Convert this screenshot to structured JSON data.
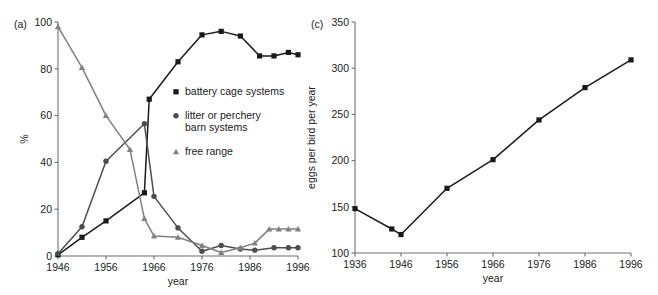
{
  "figure": {
    "background": "#ffffff",
    "panels": [
      "a",
      "c"
    ]
  },
  "panel_a": {
    "label": "(a)",
    "xlabel": "year",
    "ylabel": "%",
    "legend": [
      {
        "label": "battery cage systems",
        "marker": "square",
        "color": "#1a1a1a"
      },
      {
        "label": "litter or perchery",
        "label2": "barn systems",
        "marker": "circle",
        "color": "#4d4d4d"
      },
      {
        "label": "free range",
        "marker": "triangle",
        "color": "#808080"
      }
    ]
  },
  "panel_c": {
    "label": "(c)",
    "xlabel": "year",
    "ylabel": "eggs per bird per year"
  },
  "chart_data": [
    {
      "type": "line",
      "panel": "(a)",
      "title": "",
      "xlabel": "year",
      "ylabel": "%",
      "xlim": [
        1946,
        1996
      ],
      "ylim": [
        0,
        100
      ],
      "xticks": [
        1946,
        1956,
        1966,
        1976,
        1986,
        1996
      ],
      "yticks": [
        0,
        20,
        40,
        60,
        80,
        100
      ],
      "grid": false,
      "legend_position": "center",
      "series": [
        {
          "name": "battery cage systems",
          "marker": "square",
          "color": "#1a1a1a",
          "points": [
            {
              "x": 1946,
              "y": 0.5
            },
            {
              "x": 1951,
              "y": 8
            },
            {
              "x": 1956,
              "y": 15
            },
            {
              "x": 1964,
              "y": 27
            },
            {
              "x": 1965,
              "y": 67
            },
            {
              "x": 1971,
              "y": 83
            },
            {
              "x": 1976,
              "y": 94.5
            },
            {
              "x": 1980,
              "y": 96
            },
            {
              "x": 1984,
              "y": 94
            },
            {
              "x": 1988,
              "y": 85.5
            },
            {
              "x": 1991,
              "y": 85.5
            },
            {
              "x": 1994,
              "y": 87
            },
            {
              "x": 1996,
              "y": 86
            }
          ]
        },
        {
          "name": "litter or perchery barn systems",
          "marker": "circle",
          "color": "#4d4d4d",
          "points": [
            {
              "x": 1946,
              "y": 1
            },
            {
              "x": 1951,
              "y": 12.5
            },
            {
              "x": 1956,
              "y": 40.5
            },
            {
              "x": 1964,
              "y": 56.5
            },
            {
              "x": 1966,
              "y": 25.5
            },
            {
              "x": 1971,
              "y": 12
            },
            {
              "x": 1976,
              "y": 2
            },
            {
              "x": 1980,
              "y": 4.5
            },
            {
              "x": 1984,
              "y": 3
            },
            {
              "x": 1987,
              "y": 2.5
            },
            {
              "x": 1991,
              "y": 3.5
            },
            {
              "x": 1994,
              "y": 3.5
            },
            {
              "x": 1996,
              "y": 3.5
            }
          ]
        },
        {
          "name": "free range",
          "marker": "triangle",
          "color": "#808080",
          "points": [
            {
              "x": 1946,
              "y": 98
            },
            {
              "x": 1951,
              "y": 80.5
            },
            {
              "x": 1956,
              "y": 60
            },
            {
              "x": 1961,
              "y": 45.5
            },
            {
              "x": 1964,
              "y": 16
            },
            {
              "x": 1966,
              "y": 8.5
            },
            {
              "x": 1971,
              "y": 8
            },
            {
              "x": 1976,
              "y": 4.5
            },
            {
              "x": 1980,
              "y": 1.5
            },
            {
              "x": 1984,
              "y": 3.5
            },
            {
              "x": 1987,
              "y": 5.5
            },
            {
              "x": 1990,
              "y": 11.5
            },
            {
              "x": 1992,
              "y": 11.5
            },
            {
              "x": 1994,
              "y": 11.5
            },
            {
              "x": 1996,
              "y": 11.5
            }
          ]
        }
      ]
    },
    {
      "type": "line",
      "panel": "(c)",
      "title": "",
      "xlabel": "year",
      "ylabel": "eggs per bird per year",
      "xlim": [
        1936,
        1996
      ],
      "ylim": [
        100,
        350
      ],
      "xticks": [
        1936,
        1946,
        1956,
        1966,
        1976,
        1986,
        1996
      ],
      "yticks": [
        100,
        150,
        200,
        250,
        300,
        350
      ],
      "grid": false,
      "series": [
        {
          "name": "eggs per bird per year",
          "marker": "square",
          "color": "#1a1a1a",
          "points": [
            {
              "x": 1936,
              "y": 148
            },
            {
              "x": 1944,
              "y": 126
            },
            {
              "x": 1946,
              "y": 120
            },
            {
              "x": 1956,
              "y": 170
            },
            {
              "x": 1966,
              "y": 201
            },
            {
              "x": 1976,
              "y": 244
            },
            {
              "x": 1986,
              "y": 279
            },
            {
              "x": 1996,
              "y": 309
            }
          ]
        }
      ]
    }
  ]
}
